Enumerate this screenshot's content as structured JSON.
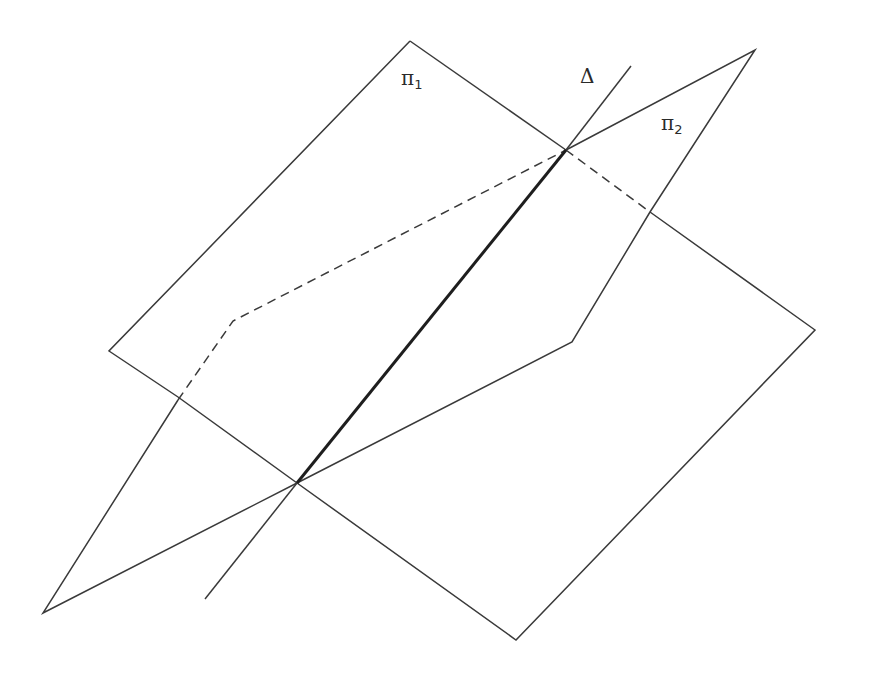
{
  "labels": {
    "plane1": {
      "symbol": "π",
      "sub": "1"
    },
    "plane2": {
      "symbol": "π",
      "sub": "2"
    },
    "line": {
      "symbol": "Δ"
    }
  },
  "colors": {
    "stroke": "#3a3a3a",
    "intersection": "#1e1e1e"
  },
  "geometry": {
    "plane1": [
      [
        410,
        41
      ],
      [
        109,
        351
      ],
      [
        516,
        640
      ],
      [
        815,
        330
      ]
    ],
    "plane2_solid": [
      [
        566,
        150
      ],
      [
        755,
        50
      ],
      [
        650,
        212
      ]
    ],
    "plane2_solid2": [
      [
        650,
        212
      ],
      [
        572,
        342
      ],
      [
        297,
        483
      ],
      [
        43,
        613
      ],
      [
        178,
        400
      ]
    ],
    "plane2_dashed": [
      [
        178,
        400
      ],
      [
        233,
        321
      ],
      [
        566,
        150
      ]
    ],
    "plane1_dashed": [
      [
        566,
        150
      ],
      [
        650,
        212
      ]
    ],
    "delta": [
      [
        631,
        66
      ],
      [
        205,
        599
      ]
    ],
    "delta_bold": [
      [
        297,
        483
      ],
      [
        566,
        150
      ]
    ]
  }
}
